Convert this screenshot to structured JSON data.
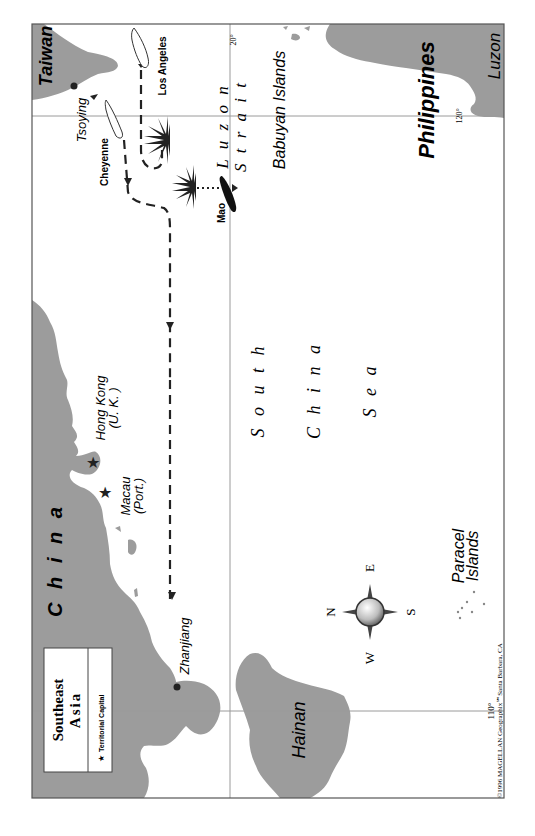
{
  "map": {
    "legend": {
      "title_line1": "Southeast",
      "title_line2": "Asia",
      "item_symbol": "★",
      "item_label": "Territorial Capital"
    },
    "countries": {
      "taiwan": "Taiwan",
      "china": "C h i n a",
      "philippines": "Philippines"
    },
    "regions": {
      "luzon": "Luzon",
      "hainan": "Hainan",
      "babuyan": "Babuyan Islands",
      "paracel_line1": "Paracel",
      "paracel_line2": "Islands"
    },
    "water": {
      "luzon_strait_line1": "L u z o n",
      "luzon_strait_line2": "S t r a i t",
      "south": "S o u t h",
      "china": "C h i n a",
      "sea": "S e a"
    },
    "places": {
      "tsoying": "Tsoying",
      "hong_kong_line1": "Hong Kong",
      "hong_kong_line2": "(U. K. )",
      "macau_line1": "Macau",
      "macau_line2": "(Port.)",
      "zhanjiang": "Zhanjiang"
    },
    "ships": {
      "cheyenne": "Cheyenne",
      "los_angeles": "Los Angeles",
      "mao": "Mao"
    },
    "graticule": {
      "lat_20": "20°",
      "lon_120": "120°",
      "lon_110": "110°"
    },
    "compass": {
      "n": "N",
      "e": "E",
      "s": "S",
      "w": "W"
    },
    "credit": "©1996 MAGELLAN Geographix℠Santa Barbara, CA",
    "colors": {
      "land": "#9c9c9c",
      "water": "#ffffff",
      "frame": "#555555"
    }
  }
}
